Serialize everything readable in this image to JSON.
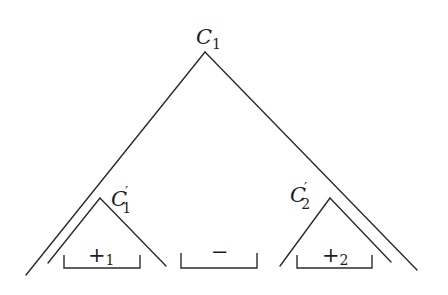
{
  "diagram": {
    "type": "nested-triangle-tree",
    "root": {
      "label": "C",
      "subscript": "1",
      "prime": ""
    },
    "children": [
      {
        "label": "C",
        "subscript": "1",
        "prime": "′"
      },
      {
        "label": "C",
        "subscript": "2",
        "prime": "′"
      }
    ],
    "intervals": [
      {
        "symbol": "+",
        "subscript": "1"
      },
      {
        "symbol": "−",
        "subscript": ""
      },
      {
        "symbol": "+",
        "subscript": "2"
      }
    ],
    "colors": {
      "line": "#2b2b2b",
      "text": "#1e1e1e",
      "background": "#ffffff"
    }
  }
}
